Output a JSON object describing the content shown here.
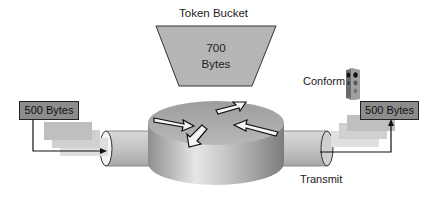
{
  "token_bucket": {
    "title": "Token Bucket",
    "value": "700",
    "unit": "Bytes",
    "fill_color": "#b5b5b5"
  },
  "incoming_packet": {
    "label": "500 Bytes",
    "ghost_count": 3
  },
  "outgoing_packet": {
    "label": "500 Bytes",
    "ghost_count": 3
  },
  "conform_indicator": {
    "label": "Conform",
    "icon": "traffic-light-icon"
  },
  "transmit": {
    "label": "Transmit"
  },
  "router": {
    "icon": "router-icon",
    "arrows": 4
  },
  "colors": {
    "packet_fill": "#8c8c8c",
    "ghost_1": "#bdbdbd",
    "ghost_2": "#cfcfcf",
    "ghost_3": "#dcdcdc",
    "pipe": "#c8c8c8",
    "router_top": "#a9a9a9",
    "router_side": "#b0b0b0"
  }
}
